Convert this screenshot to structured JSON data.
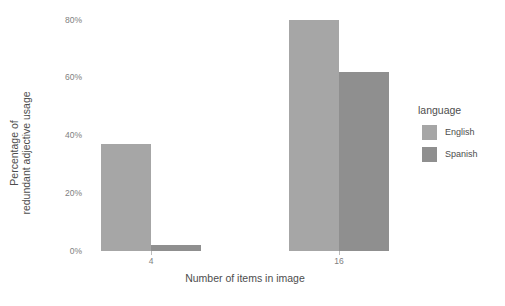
{
  "chart_data": {
    "type": "bar",
    "title": "",
    "subtitle": "",
    "xlabel": "Number of items in image",
    "ylabel": "Percentage of redundant adjective usage",
    "ylabel_lines": [
      "Percentage of",
      "redundant adjective usage"
    ],
    "categories": [
      "4",
      "16"
    ],
    "series": [
      {
        "name": "English",
        "values": [
          37,
          80
        ],
        "color": "#a6a6a6"
      },
      {
        "name": "Spanish",
        "values": [
          2,
          62
        ],
        "color": "#8f8f8f"
      }
    ],
    "ylim": [
      0,
      84
    ],
    "yticks": [
      0,
      20,
      40,
      60,
      80
    ],
    "ytick_labels": [
      "0%",
      "20%",
      "40%",
      "60%",
      "80%"
    ],
    "xtick_labels": [
      "4",
      "16"
    ],
    "grid": false,
    "legend": {
      "position": "right",
      "title": "language",
      "entries": [
        "English",
        "Spanish"
      ]
    },
    "background": "#ffffff",
    "value_suffix": "%"
  }
}
